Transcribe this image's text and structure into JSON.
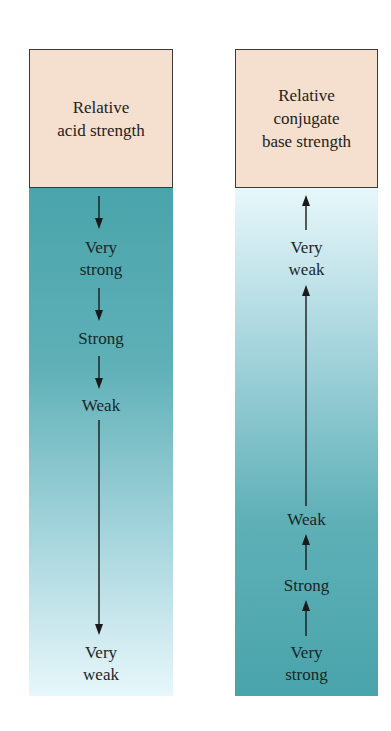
{
  "acid_column": {
    "header": [
      "Relative",
      "acid strength"
    ],
    "arrow_direction": "down",
    "levels": [
      {
        "label": [
          "Very",
          "strong"
        ]
      },
      {
        "label": [
          "Strong"
        ]
      },
      {
        "label": [
          "Weak"
        ]
      },
      {
        "label": [
          "Very",
          "weak"
        ]
      }
    ],
    "gradient_top": "#4aa4ab",
    "gradient_bottom": "#e7f7fb"
  },
  "base_column": {
    "header": [
      "Relative",
      "conjugate",
      "base strength"
    ],
    "arrow_direction": "up",
    "levels": [
      {
        "label": [
          "Very",
          "weak"
        ]
      },
      {
        "label": [
          "Weak"
        ]
      },
      {
        "label": [
          "Strong"
        ]
      },
      {
        "label": [
          "Very",
          "strong"
        ]
      }
    ],
    "gradient_top": "#e7f7fb",
    "gradient_bottom": "#4aa4ab"
  },
  "colors": {
    "header_fill": "#f5dfcf",
    "header_border": "#3a3a3a",
    "arrow": "#1a1a1a"
  }
}
